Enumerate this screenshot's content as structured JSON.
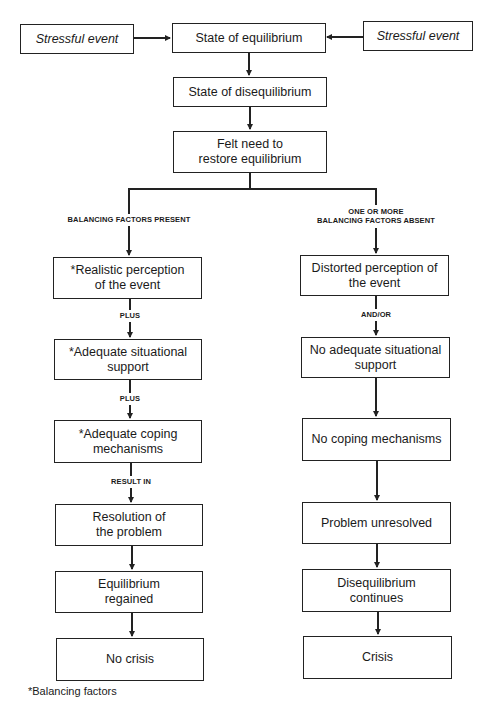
{
  "diagram": {
    "type": "flowchart",
    "top": {
      "stressful_event_left": "Stressful event",
      "state_of_equilibrium": "State of equilibrium",
      "stressful_event_right": "Stressful event",
      "state_of_disequilibrium": "State of disequilibrium",
      "felt_need": "Felt need to restore equilibrium"
    },
    "left_branch": {
      "condition": "BALANCING FACTORS PRESENT",
      "nodes": [
        "*Realistic perception of the event",
        "*Adequate situational support",
        "*Adequate coping mechanisms",
        "Resolution of the problem",
        "Equilibrium regained",
        "No crisis"
      ],
      "connectors": [
        "PLUS",
        "PLUS",
        "RESULT IN"
      ]
    },
    "right_branch": {
      "condition_line1": "ONE OR MORE",
      "condition_line2": "BALANCING FACTORS ABSENT",
      "nodes": [
        "Distorted perception of the event",
        "No adequate situational support",
        "No coping mechanisms",
        "Problem unresolved",
        "Disequilibrium continues",
        "Crisis"
      ],
      "connectors": [
        "AND/OR"
      ]
    },
    "footnote": "*Balancing factors"
  }
}
